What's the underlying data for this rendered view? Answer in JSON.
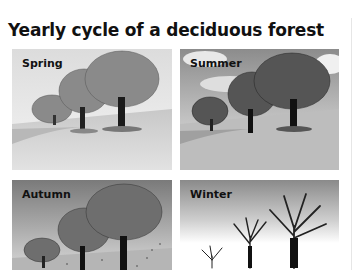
{
  "title": "Yearly cycle of a deciduous forest",
  "panels": [
    {
      "season": "Spring",
      "foliage": "light-leafed",
      "sky": "light gray"
    },
    {
      "season": "Summer",
      "foliage": "full dark leaves",
      "sky": "cloudy gray"
    },
    {
      "season": "Autumn",
      "foliage": "thinning leaves, falling",
      "sky": "dark gray"
    },
    {
      "season": "Winter",
      "foliage": "bare branches",
      "sky": "gray to white, snow ground"
    }
  ],
  "colors": {
    "text": "#111111",
    "background": "#ffffff"
  }
}
